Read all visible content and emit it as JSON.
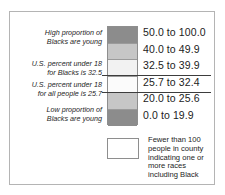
{
  "legend": {
    "annotations": {
      "high": [
        "High proportion of",
        "Blacks are young"
      ],
      "black_benchmark": [
        "U.S. percent under 18",
        "for Blacks is 32.5"
      ],
      "all_benchmark": [
        "U.S. percent under 18",
        "for all people is 25.7"
      ],
      "low": [
        "Low proportion of",
        "Blacks are young"
      ]
    },
    "classes": [
      {
        "label": "50.0 to 100.0",
        "color": "#8c8c8c",
        "min": 50.0,
        "max": 100.0
      },
      {
        "label": "40.0 to 49.9",
        "color": "#c6c6c6",
        "min": 40.0,
        "max": 49.9
      },
      {
        "label": "32.5 to 39.9",
        "color": "#f2f2f2",
        "min": 32.5,
        "max": 39.9
      },
      {
        "label": "25.7 to 32.4",
        "color": "#fbfbfb",
        "min": 25.7,
        "max": 32.4
      },
      {
        "label": "20.0 to 25.6",
        "color": "#c6c6c6",
        "min": 20.0,
        "max": 25.6
      },
      {
        "label": "0.0 to 19.9",
        "color": "#8c8c8c",
        "min": 0.0,
        "max": 19.9
      }
    ],
    "footnote": {
      "swatch_color": "#ffffff",
      "lines": [
        "Fewer than 100",
        "people in county",
        "indicating one or",
        "more races",
        "including Black"
      ]
    },
    "leader_line_color": "#3d3d3d",
    "border_color": "#b4b4b4"
  }
}
